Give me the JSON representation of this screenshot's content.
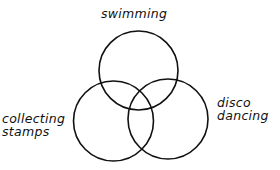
{
  "diagram": {
    "type": "venn",
    "stroke_color": "#111111",
    "sets": [
      {
        "id": "swimming",
        "lines": [
          "swimming"
        ]
      },
      {
        "id": "collecting-stamps",
        "lines": [
          "collecting",
          "stamps"
        ]
      },
      {
        "id": "disco-dancing",
        "lines": [
          "disco",
          "dancing"
        ]
      }
    ]
  }
}
